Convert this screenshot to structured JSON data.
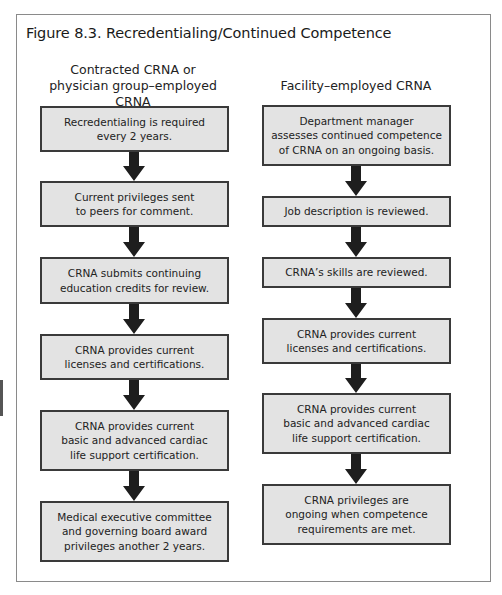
{
  "figure": {
    "title": "Figure 8.3. Recredentialing/Continued Competence"
  },
  "columns": [
    {
      "heading": "Contracted CRNA or\nphysician group–employed CRNA",
      "steps": [
        "Recredentialing is required\nevery 2 years.",
        "Current privileges sent\nto peers for comment.",
        "CRNA submits continuing\neducation credits for review.",
        "CRNA provides current\nlicenses and certifications.",
        "CRNA provides current\nbasic and advanced cardiac\nlife support certification.",
        "Medical executive committee\nand governing board award\nprivileges another 2 years."
      ]
    },
    {
      "heading": "Facility–employed CRNA",
      "steps": [
        "Department manager\nassesses continued competence\nof CRNA on an ongoing basis.",
        "Job description is reviewed.",
        "CRNA’s skills are reviewed.",
        "CRNA provides current\nlicenses and certifications.",
        "CRNA provides current\nbasic and advanced cardiac\nlife support certification.",
        "CRNA privileges are\nongoing when competence\nrequirements are met."
      ]
    }
  ],
  "colors": {
    "box_fill": "#e3e3e3",
    "box_border": "#3a3a3a",
    "arrow": "#1e1e1e",
    "frame": "#8a8a8a"
  }
}
